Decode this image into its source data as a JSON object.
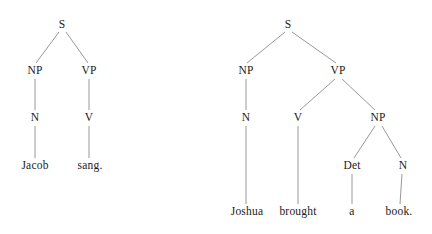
{
  "figure": {
    "type": "syntax-tree-diagram",
    "background_color": "#ffffff",
    "edge_color": "#8c8c8c",
    "text_color": "#1a1a1a"
  },
  "trees": [
    {
      "id": "tree-left",
      "sentence": "Jacob sang.",
      "nodes": [
        {
          "id": "l-s",
          "label": "S",
          "x": 62,
          "y": 25,
          "level": 0
        },
        {
          "id": "l-np",
          "label": "NP",
          "x": 35,
          "y": 71,
          "level": 1
        },
        {
          "id": "l-vp",
          "label": "VP",
          "x": 89,
          "y": 71,
          "level": 1
        },
        {
          "id": "l-n",
          "label": "N",
          "x": 35,
          "y": 118,
          "level": 2
        },
        {
          "id": "l-v",
          "label": "V",
          "x": 89,
          "y": 118,
          "level": 2
        },
        {
          "id": "l-jacob",
          "label": "Jacob",
          "x": 35,
          "y": 166,
          "level": 3
        },
        {
          "id": "l-sang",
          "label": "sang.",
          "x": 90,
          "y": 166,
          "level": 3
        }
      ],
      "edges": [
        {
          "from": "l-s",
          "to": "l-np",
          "x1": 59,
          "y1": 32,
          "x2": 36,
          "y2": 63
        },
        {
          "from": "l-s",
          "to": "l-vp",
          "x1": 66,
          "y1": 32,
          "x2": 88,
          "y2": 63
        },
        {
          "from": "l-np",
          "to": "l-n",
          "x1": 35,
          "y1": 79,
          "x2": 35,
          "y2": 110
        },
        {
          "from": "l-vp",
          "to": "l-v",
          "x1": 89,
          "y1": 79,
          "x2": 89,
          "y2": 110
        },
        {
          "from": "l-n",
          "to": "l-jacob",
          "x1": 35,
          "y1": 126,
          "x2": 35,
          "y2": 158
        },
        {
          "from": "l-v",
          "to": "l-sang",
          "x1": 89,
          "y1": 126,
          "x2": 89,
          "y2": 158
        }
      ]
    },
    {
      "id": "tree-right",
      "sentence": "Joshua brought a book.",
      "nodes": [
        {
          "id": "r-s",
          "label": "S",
          "x": 288,
          "y": 25,
          "level": 0
        },
        {
          "id": "r-np1",
          "label": "NP",
          "x": 246,
          "y": 71,
          "level": 1
        },
        {
          "id": "r-vp",
          "label": "VP",
          "x": 338,
          "y": 71,
          "level": 1
        },
        {
          "id": "r-n1",
          "label": "N",
          "x": 246,
          "y": 118,
          "level": 2
        },
        {
          "id": "r-v",
          "label": "V",
          "x": 298,
          "y": 118,
          "level": 2
        },
        {
          "id": "r-np2",
          "label": "NP",
          "x": 378,
          "y": 118,
          "level": 2
        },
        {
          "id": "r-det",
          "label": "Det",
          "x": 352,
          "y": 166,
          "level": 3
        },
        {
          "id": "r-n2",
          "label": "N",
          "x": 403,
          "y": 166,
          "level": 3
        },
        {
          "id": "r-joshua",
          "label": "Joshua",
          "x": 247,
          "y": 212,
          "level": 4
        },
        {
          "id": "r-brought",
          "label": "brought",
          "x": 298,
          "y": 212,
          "level": 4
        },
        {
          "id": "r-a",
          "label": "a",
          "x": 352,
          "y": 212,
          "level": 4
        },
        {
          "id": "r-book",
          "label": "book.",
          "x": 399,
          "y": 212,
          "level": 4
        }
      ],
      "edges": [
        {
          "from": "r-s",
          "to": "r-np1",
          "x1": 285,
          "y1": 32,
          "x2": 247,
          "y2": 63
        },
        {
          "from": "r-s",
          "to": "r-vp",
          "x1": 292,
          "y1": 32,
          "x2": 336,
          "y2": 63
        },
        {
          "from": "r-np1",
          "to": "r-n1",
          "x1": 246,
          "y1": 79,
          "x2": 246,
          "y2": 110
        },
        {
          "from": "r-vp",
          "to": "r-v",
          "x1": 335,
          "y1": 79,
          "x2": 300,
          "y2": 110
        },
        {
          "from": "r-vp",
          "to": "r-np2",
          "x1": 342,
          "y1": 79,
          "x2": 375,
          "y2": 110
        },
        {
          "from": "r-n1",
          "to": "r-joshua",
          "x1": 246,
          "y1": 126,
          "x2": 246,
          "y2": 204
        },
        {
          "from": "r-v",
          "to": "r-brought",
          "x1": 298,
          "y1": 126,
          "x2": 298,
          "y2": 204
        },
        {
          "from": "r-np2",
          "to": "r-det",
          "x1": 375,
          "y1": 126,
          "x2": 354,
          "y2": 158
        },
        {
          "from": "r-np2",
          "to": "r-n2",
          "x1": 382,
          "y1": 126,
          "x2": 401,
          "y2": 158
        },
        {
          "from": "r-det",
          "to": "r-a",
          "x1": 352,
          "y1": 174,
          "x2": 352,
          "y2": 204
        },
        {
          "from": "r-n2",
          "to": "r-book",
          "x1": 402,
          "y1": 174,
          "x2": 400,
          "y2": 204
        }
      ]
    }
  ]
}
